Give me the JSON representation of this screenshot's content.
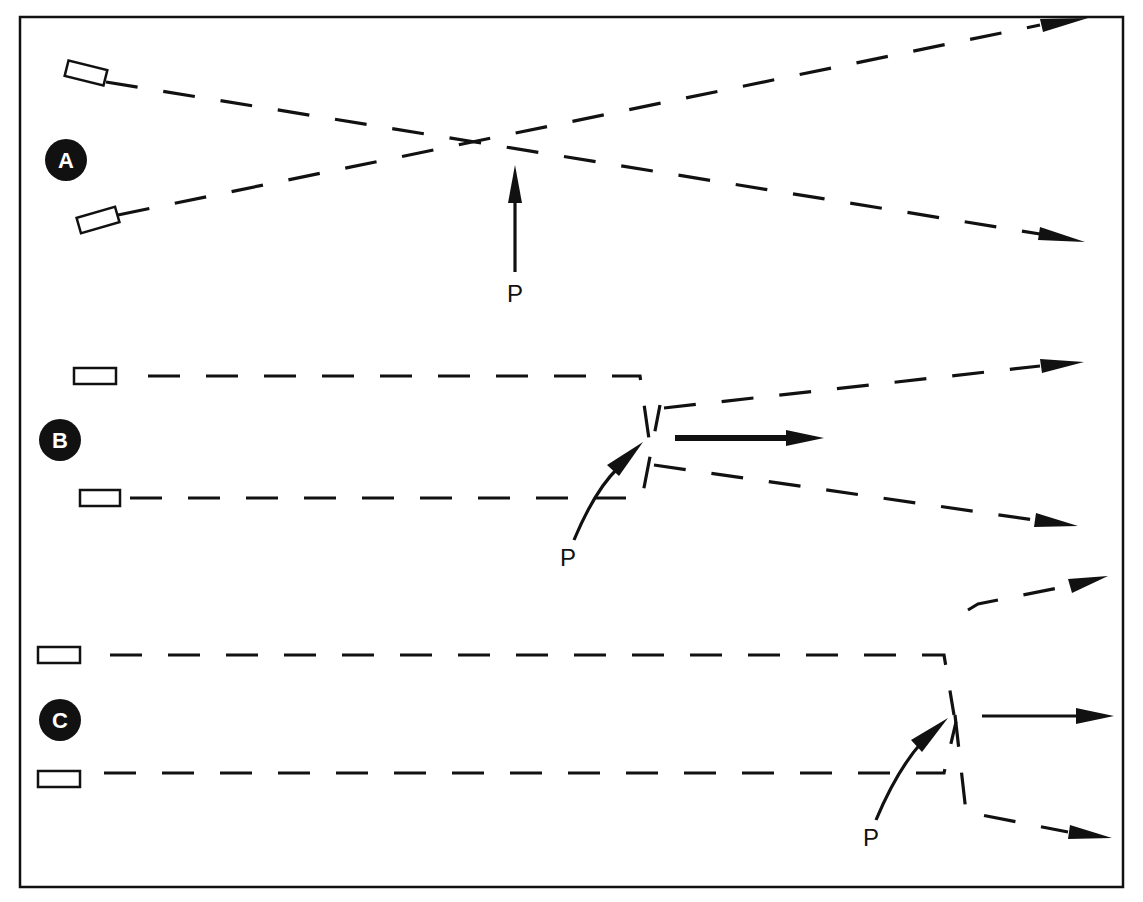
{
  "diagram": {
    "panels": [
      {
        "id": "A",
        "label": "A",
        "pointer_label": "P",
        "description": "Two beams crossing at point P"
      },
      {
        "id": "B",
        "label": "B",
        "pointer_label": "P",
        "description": "Parallel beams converging and diverging at point P with central arrow"
      },
      {
        "id": "C",
        "label": "C",
        "pointer_label": "P",
        "description": "Parallel beams converging and diverging at point P further right with central arrow"
      }
    ],
    "colors": {
      "ink": "#111111",
      "background": "#ffffff"
    }
  }
}
